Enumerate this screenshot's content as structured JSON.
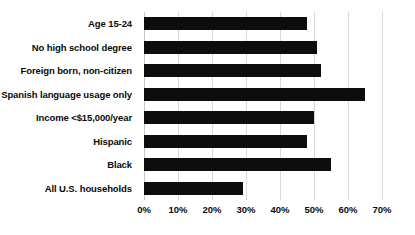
{
  "chart_data": {
    "type": "bar",
    "orientation": "horizontal",
    "title": "",
    "subtitle": "",
    "xlabel": "",
    "ylabel": "",
    "categories": [
      "Age 15-24",
      "No high school degree",
      "Foreign born, non-citizen",
      "Spanish language usage only",
      "Income <$15,000/year",
      "Hispanic",
      "Black",
      "All U.S. households"
    ],
    "values": [
      48,
      51,
      52,
      65,
      50,
      48,
      55,
      29
    ],
    "value_unit": "%",
    "xlim": [
      0,
      70
    ],
    "xticks": [
      0,
      10,
      20,
      30,
      40,
      50,
      60,
      70
    ],
    "xtick_labels": [
      "0%",
      "10%",
      "20%",
      "30%",
      "40%",
      "50%",
      "60%",
      "70%"
    ],
    "grid": "vertical",
    "legend": "none",
    "bar_color": "#0d0d0d",
    "gridline_color": "#d9d9d9",
    "background_color": "#ffffff"
  }
}
